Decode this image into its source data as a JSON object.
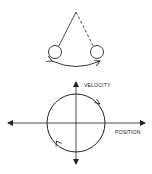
{
  "diagram": {
    "pendulum": {
      "description": "Swinging pendulum with two bob positions and swing arc",
      "pivot": [
        76,
        12
      ],
      "bob_left": {
        "cx": 55,
        "cy": 52,
        "r": 6.5,
        "string": "solid"
      },
      "bob_right": {
        "cx": 97,
        "cy": 52,
        "r": 6.5,
        "string": "dashed"
      },
      "swing_arrow": "double-headed arc"
    },
    "phase_plot": {
      "x_axis_label": "POSITION",
      "y_axis_label": "VELOCITY",
      "orbit": "circle",
      "orbit_direction": "clockwise",
      "center": [
        76,
        123
      ],
      "radius": 29
    },
    "colors": {
      "stroke": "#222222",
      "background": "#ffffff"
    }
  }
}
